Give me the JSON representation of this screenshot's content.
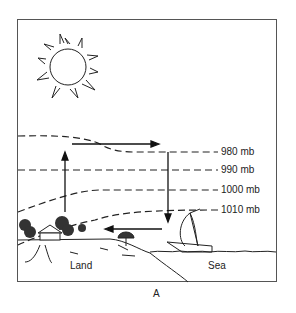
{
  "diagram": {
    "caption": "A",
    "isobars": [
      {
        "label": "980 mb"
      },
      {
        "label": "990 mb"
      },
      {
        "label": "1000 mb"
      },
      {
        "label": "1010 mb"
      }
    ],
    "regions": {
      "land": "Land",
      "sea": "Sea"
    },
    "elements": [
      "sun-icon",
      "house-icon",
      "trees-icon",
      "umbrella-icon",
      "sailboat-icon"
    ],
    "circulation": [
      "rising-air-over-land",
      "upper-flow-toward-sea",
      "sinking-air-over-sea",
      "surface-flow-toward-land"
    ]
  }
}
